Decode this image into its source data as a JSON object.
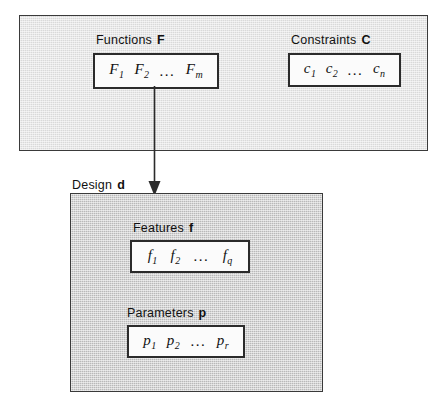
{
  "diagram": {
    "colors": {
      "upper_panel_fill": "#d9d9d9",
      "lower_panel_fill": "#b9b9b9",
      "set_box_fill": "#fbfbfb",
      "stroke": "#2b2b2b"
    }
  },
  "upper_panel": {
    "functions": {
      "caption_label": "Functions",
      "caption_symbol": "F",
      "elements": [
        {
          "base": "F",
          "sub": "1"
        },
        {
          "base": "F",
          "sub": "2"
        },
        {
          "base": "F",
          "sub": "m"
        }
      ],
      "ellipsis": "..."
    },
    "constraints": {
      "caption_label": "Constraints",
      "caption_symbol": "C",
      "elements": [
        {
          "base": "c",
          "sub": "1"
        },
        {
          "base": "c",
          "sub": "2"
        },
        {
          "base": "c",
          "sub": "n"
        }
      ],
      "ellipsis": "..."
    }
  },
  "lower_panel": {
    "caption_label": "Design",
    "caption_symbol": "d",
    "features": {
      "caption_label": "Features",
      "caption_symbol": "f",
      "elements": [
        {
          "base": "f",
          "sub": "1"
        },
        {
          "base": "f",
          "sub": "2"
        },
        {
          "base": "f",
          "sub": "q"
        }
      ],
      "ellipsis": "..."
    },
    "parameters": {
      "caption_label": "Parameters",
      "caption_symbol": "p",
      "elements": [
        {
          "base": "p",
          "sub": "1"
        },
        {
          "base": "p",
          "sub": "2"
        },
        {
          "base": "p",
          "sub": "r"
        }
      ],
      "ellipsis": "..."
    }
  },
  "arrow": {
    "name": "functions-to-design-arrow",
    "direction": "down"
  }
}
